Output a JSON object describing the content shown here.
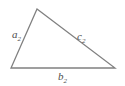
{
  "canvas": {
    "width": 125,
    "height": 86,
    "background_color": "#ffffff"
  },
  "diagram": {
    "type": "triangle",
    "shape_name": "scalene-triangle",
    "stroke_color": "#808080",
    "stroke_width": 1.3,
    "fill": "none",
    "vertices": [
      {
        "name": "apex",
        "x": 37,
        "y": 9
      },
      {
        "name": "bottom-right",
        "x": 115,
        "y": 68
      },
      {
        "name": "bottom-left",
        "x": 11,
        "y": 68
      }
    ],
    "points_attr": "37,9 115,68 11,68"
  },
  "labels": {
    "side_a": {
      "base": "a",
      "subscript": "2",
      "full": "a2",
      "x": 12,
      "y": 38,
      "color": "#4d4d4d",
      "describes": "left side"
    },
    "side_b": {
      "base": "b",
      "subscript": "2",
      "full": "b2",
      "x": 58,
      "y": 80,
      "color": "#4d4d4d",
      "describes": "base side"
    },
    "side_c": {
      "base": "c",
      "subscript": "2",
      "full": "c2",
      "x": 77,
      "y": 40,
      "color": "#4d4d4d",
      "describes": "right side hypotenuse"
    }
  }
}
